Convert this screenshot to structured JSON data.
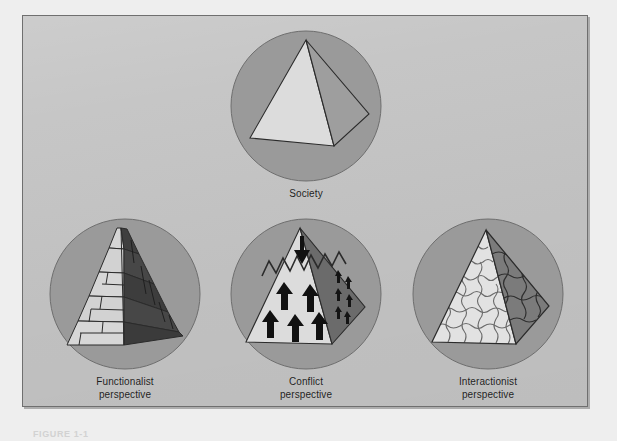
{
  "figure": {
    "bottom_caption": "FIGURE 1-1",
    "colors": {
      "page_background": "#eeeeee",
      "panel_background": "#c3c3c3",
      "panel_border": "#6f6f6f",
      "circle_fill": "#9a9a9a",
      "circle_stroke": "#6e6e6e",
      "pyramid_front": "#d8d8d8",
      "pyramid_side": "#4e4e4e",
      "outline": "#2b2b2b",
      "label_text": "#1d1d1d"
    }
  },
  "diagrams": [
    {
      "id": "society",
      "icon": "pyramid-in-circle-icon",
      "label_lines": [
        "Society"
      ],
      "description": "Plain pyramid inside circle"
    },
    {
      "id": "functionalist",
      "icon": "brick-pyramid-icon",
      "label_lines": [
        "Functionalist",
        "perspective"
      ],
      "description": "Pyramid built of interlocking brick tiers"
    },
    {
      "id": "conflict",
      "icon": "cracked-pyramid-arrows-icon",
      "label_lines": [
        "Conflict",
        "perspective"
      ],
      "description": "Pyramid with zigzag crack, downward arrow at apex and upward arrows below"
    },
    {
      "id": "interactionist",
      "icon": "jigsaw-pyramid-icon",
      "label_lines": [
        "Interactionist",
        "perspective"
      ],
      "description": "Pyramid composed of jigsaw puzzle pieces"
    }
  ]
}
